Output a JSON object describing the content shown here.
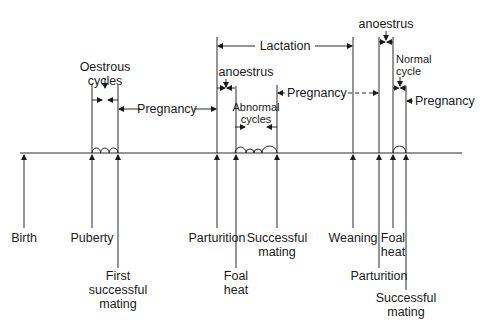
{
  "diagram": {
    "events_below": [
      {
        "id": "birth",
        "label": [
          "Birth"
        ]
      },
      {
        "id": "puberty",
        "label": [
          "Puberty"
        ]
      },
      {
        "id": "first-successful-mating",
        "label": [
          "First",
          "successful",
          "mating"
        ]
      },
      {
        "id": "parturition-1",
        "label": [
          "Parturition"
        ]
      },
      {
        "id": "foal-heat-1",
        "label": [
          "Foal",
          "heat"
        ]
      },
      {
        "id": "successful-mating-1",
        "label": [
          "Successful",
          "mating"
        ]
      },
      {
        "id": "weaning",
        "label": [
          "Weaning"
        ]
      },
      {
        "id": "parturition-2",
        "label": [
          "Parturition"
        ]
      },
      {
        "id": "foal-heat-2",
        "label": [
          "Foal",
          "heat"
        ]
      },
      {
        "id": "successful-mating-2",
        "label": [
          "Successful",
          "mating"
        ]
      }
    ],
    "periods_above": [
      {
        "id": "oestrous-cycles",
        "label": [
          "Oestrous",
          "cycles"
        ]
      },
      {
        "id": "pregnancy-1",
        "label": [
          "Pregnancy"
        ]
      },
      {
        "id": "lactation",
        "label": [
          "Lactation"
        ]
      },
      {
        "id": "anoestrus-1",
        "label": [
          "anoestrus"
        ]
      },
      {
        "id": "abnormal-cycles",
        "label": [
          "Abnormal",
          "cycles"
        ]
      },
      {
        "id": "pregnancy-2",
        "label": [
          "Pregnancy"
        ]
      },
      {
        "id": "anoestrus-2",
        "label": [
          "anoestrus"
        ]
      },
      {
        "id": "normal-cycle",
        "label": [
          "Normal",
          "cycle"
        ]
      },
      {
        "id": "pregnancy-3",
        "label": [
          "Pregnancy"
        ]
      }
    ]
  }
}
